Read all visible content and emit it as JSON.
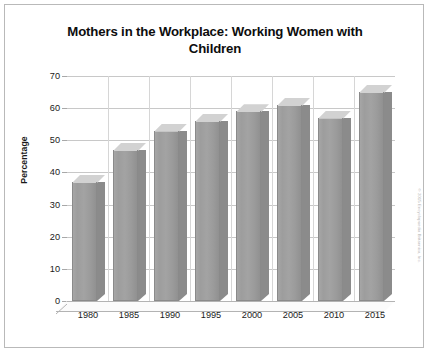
{
  "chart_data": {
    "type": "bar",
    "title": "Mothers in the Workplace: Working Women with Children",
    "title_line1": "Mothers in the Workplace: Working Women with",
    "title_line2": "Children",
    "xlabel": "",
    "ylabel": "Percentage",
    "categories": [
      "1980",
      "1985",
      "1990",
      "1995",
      "2000",
      "2005",
      "2010",
      "2015"
    ],
    "values": [
      37,
      47,
      53,
      56,
      59,
      61,
      57,
      65
    ],
    "ylim": [
      0,
      70
    ],
    "ytick_step": 10,
    "yticks": [
      "70",
      "60",
      "50",
      "40",
      "30",
      "20",
      "10",
      "0"
    ],
    "ytick_values": [
      70,
      60,
      50,
      40,
      30,
      20,
      10,
      0
    ],
    "grid": true,
    "grid_orientation": "both",
    "legend": false,
    "legend_position": "none",
    "series_name": "Percentage",
    "style": "3d-column",
    "colors": {
      "bar_front": "#9e9e9e",
      "bar_top": "#d2d2d2",
      "bar_side": "#8b8b8b",
      "gridline": "#c8c8c8",
      "frame_border": "#b9b9b9",
      "text": "#1a1a1a",
      "title_text": "#0d0d0d",
      "background": "#ffffff"
    }
  },
  "watermark": {
    "text": "© 2015 Encyclopaedia Britannica, Inc."
  }
}
